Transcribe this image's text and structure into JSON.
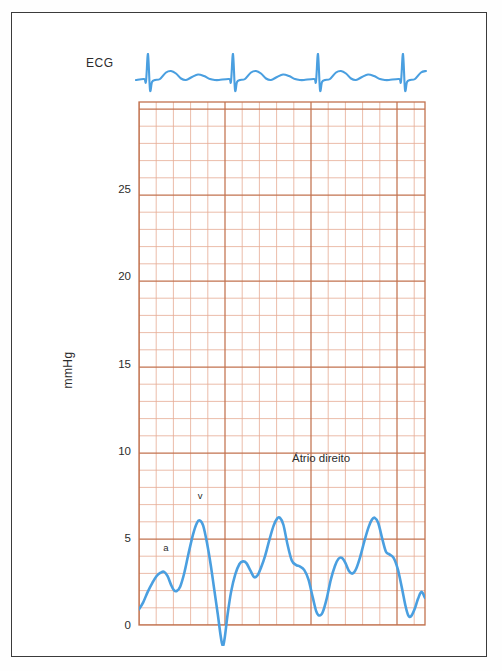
{
  "figure": {
    "kind": "hemodynamic-pressure-tracing",
    "frame_color": "#3b3b3b",
    "background_color": "#ffffff"
  },
  "ecg": {
    "label": "ECG",
    "trace_color": "#4a9fe0",
    "baseline_y_px": 80,
    "beats": 4,
    "beat_period_px": 85,
    "first_qrs_x_px": 148
  },
  "annotations": {
    "chamber": "Átrio direito",
    "a_wave": "a",
    "v_wave": "v"
  },
  "grid": {
    "major_color": "#c2724f",
    "minor_color": "#e6ab94",
    "minor_step_px": 17.2,
    "major_every": 5,
    "left_px": 139,
    "right_px": 425,
    "top_px": 102,
    "bottom_px": 625
  },
  "chart_data": {
    "type": "line",
    "title": "",
    "subtitle": "",
    "xlabel": "",
    "ylabel": "mmHg",
    "ylim": [
      0,
      30
    ],
    "yticks": [
      0,
      5,
      10,
      15,
      20,
      25
    ],
    "ytick_labels": [
      "0",
      "5",
      "10",
      "15",
      "20",
      "25"
    ],
    "grid": true,
    "legend": "none",
    "annotations": [
      {
        "text": "Átrio direito",
        "x_px": 292,
        "y_px": 462
      },
      {
        "text": "v",
        "x_px": 200,
        "y_px": 499
      },
      {
        "text": "a",
        "x_px": 166,
        "y_px": 551
      }
    ],
    "series": [
      {
        "name": "Átrio direito",
        "color": "#4a9fe0",
        "units": "mmHg",
        "points": [
          [
            0.0,
            0.9
          ],
          [
            0.12,
            1.3
          ],
          [
            0.25,
            1.9
          ],
          [
            0.38,
            2.4
          ],
          [
            0.5,
            2.8
          ],
          [
            0.62,
            3.0
          ],
          [
            0.72,
            3.05
          ],
          [
            0.82,
            2.8
          ],
          [
            0.92,
            2.3
          ],
          [
            1.0,
            2.0
          ],
          [
            1.08,
            1.95
          ],
          [
            1.18,
            2.2
          ],
          [
            1.3,
            3.0
          ],
          [
            1.42,
            4.1
          ],
          [
            1.55,
            5.2
          ],
          [
            1.66,
            5.85
          ],
          [
            1.74,
            6.0
          ],
          [
            1.84,
            5.7
          ],
          [
            1.95,
            4.7
          ],
          [
            2.06,
            3.4
          ],
          [
            2.16,
            2.0
          ],
          [
            2.26,
            0.6
          ],
          [
            2.34,
            -0.6
          ],
          [
            2.4,
            -1.2
          ],
          [
            2.46,
            -0.7
          ],
          [
            2.54,
            0.6
          ],
          [
            2.64,
            1.9
          ],
          [
            2.76,
            2.9
          ],
          [
            2.88,
            3.5
          ],
          [
            2.98,
            3.65
          ],
          [
            3.08,
            3.55
          ],
          [
            3.2,
            3.1
          ],
          [
            3.3,
            2.75
          ],
          [
            3.4,
            2.85
          ],
          [
            3.5,
            3.3
          ],
          [
            3.62,
            4.0
          ],
          [
            3.74,
            4.9
          ],
          [
            3.86,
            5.7
          ],
          [
            3.96,
            6.1
          ],
          [
            4.04,
            6.15
          ],
          [
            4.14,
            5.75
          ],
          [
            4.26,
            4.6
          ],
          [
            4.38,
            3.7
          ],
          [
            4.5,
            3.45
          ],
          [
            4.62,
            3.35
          ],
          [
            4.74,
            3.15
          ],
          [
            4.86,
            2.6
          ],
          [
            4.98,
            1.6
          ],
          [
            5.08,
            0.8
          ],
          [
            5.16,
            0.55
          ],
          [
            5.26,
            0.7
          ],
          [
            5.38,
            1.5
          ],
          [
            5.5,
            2.6
          ],
          [
            5.62,
            3.4
          ],
          [
            5.72,
            3.8
          ],
          [
            5.82,
            3.85
          ],
          [
            5.92,
            3.55
          ],
          [
            6.02,
            3.1
          ],
          [
            6.12,
            2.95
          ],
          [
            6.22,
            3.2
          ],
          [
            6.34,
            3.9
          ],
          [
            6.46,
            4.8
          ],
          [
            6.58,
            5.6
          ],
          [
            6.68,
            6.05
          ],
          [
            6.76,
            6.15
          ],
          [
            6.86,
            5.85
          ],
          [
            6.98,
            4.9
          ],
          [
            7.08,
            4.2
          ],
          [
            7.18,
            4.05
          ],
          [
            7.3,
            3.85
          ],
          [
            7.42,
            3.2
          ],
          [
            7.54,
            2.1
          ],
          [
            7.64,
            1.1
          ],
          [
            7.72,
            0.55
          ],
          [
            7.8,
            0.5
          ],
          [
            7.9,
            0.9
          ],
          [
            8.0,
            1.5
          ],
          [
            8.1,
            1.9
          ],
          [
            8.2,
            1.55
          ]
        ]
      }
    ]
  }
}
